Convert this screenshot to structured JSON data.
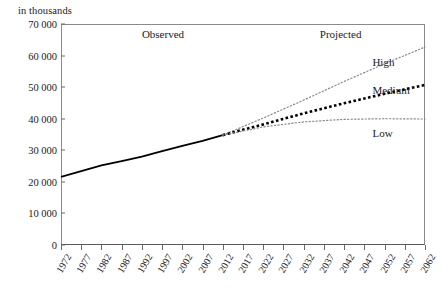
{
  "chart_data": {
    "type": "line",
    "title": "",
    "ylabel": "in thousands",
    "xlabel": "",
    "ylim": [
      0,
      70000
    ],
    "xlim": [
      1972,
      2062
    ],
    "grid": false,
    "legend_position": "inline-right",
    "y_ticks": [
      "0",
      "10 000",
      "20 000",
      "30 000",
      "40 000",
      "50 000",
      "60 000",
      "70 000"
    ],
    "y_tick_values": [
      0,
      10000,
      20000,
      30000,
      40000,
      50000,
      60000,
      70000
    ],
    "x_ticks": [
      "1972",
      "1977",
      "1982",
      "1987",
      "1992",
      "1997",
      "2002",
      "2007",
      "2012",
      "2017",
      "2022",
      "2027",
      "2032",
      "2037",
      "2042",
      "2047",
      "2052",
      "2057",
      "2062"
    ],
    "x_tick_values": [
      1972,
      1977,
      1982,
      1987,
      1992,
      1997,
      2002,
      2007,
      2012,
      2017,
      2022,
      2027,
      2032,
      2037,
      2042,
      2047,
      2052,
      2057,
      2062
    ],
    "annotations": [
      {
        "text": "Observed",
        "x": 1992,
        "y": 66500
      },
      {
        "text": "Projected",
        "x": 2036,
        "y": 66500
      }
    ],
    "series": [
      {
        "name": "Observed",
        "style": "solid",
        "color": "#000000",
        "width": 1.8,
        "x": [
          1972,
          1977,
          1982,
          1987,
          1992,
          1997,
          2002,
          2007,
          2012
        ],
        "values": [
          21600,
          23400,
          25200,
          26600,
          28000,
          29700,
          31400,
          33000,
          34800
        ]
      },
      {
        "name": "High",
        "style": "fine-dotted",
        "color": "#8a8a8a",
        "width": 1.2,
        "x": [
          2012,
          2022,
          2032,
          2042,
          2052,
          2062
        ],
        "values": [
          34800,
          40200,
          45900,
          51800,
          57400,
          62700
        ]
      },
      {
        "name": "Medium",
        "style": "bold-dotted",
        "color": "#000000",
        "width": 2.6,
        "x": [
          2012,
          2022,
          2032,
          2042,
          2052,
          2062
        ],
        "values": [
          34800,
          38200,
          41700,
          44900,
          47900,
          50700
        ]
      },
      {
        "name": "Low",
        "style": "fine-dotted",
        "color": "#8a8a8a",
        "width": 1.2,
        "x": [
          2012,
          2022,
          2032,
          2042,
          2052,
          2062
        ],
        "values": [
          34800,
          37400,
          39000,
          39800,
          40000,
          39900
        ]
      }
    ],
    "series_labels": [
      {
        "text": "High",
        "x": 2049,
        "y": 57800
      },
      {
        "text": "Medium",
        "x": 2049,
        "y": 48900
      },
      {
        "text": "Low",
        "x": 2049,
        "y": 35300
      }
    ]
  }
}
